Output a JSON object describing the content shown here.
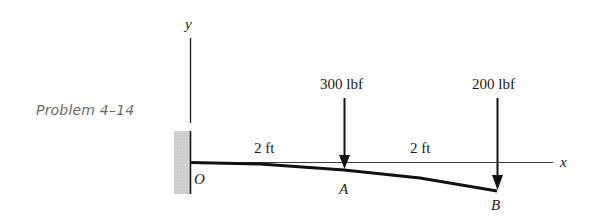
{
  "caption": "Problem 4–14",
  "axes": {
    "y_label": "y",
    "x_label": "x",
    "origin_label": "O"
  },
  "points": {
    "A": "A",
    "B": "B"
  },
  "dimensions": [
    {
      "label": "2 ft",
      "from": "O",
      "to": "A"
    },
    {
      "label": "2 ft",
      "from": "A",
      "to": "B"
    }
  ],
  "loads": [
    {
      "label": "300 lbf",
      "at": "A"
    },
    {
      "label": "200 lbf",
      "at": "B"
    }
  ],
  "colors": {
    "line": "#1a1a1a",
    "wall": "#c8c8c8",
    "caption": "#6a6a6a"
  }
}
